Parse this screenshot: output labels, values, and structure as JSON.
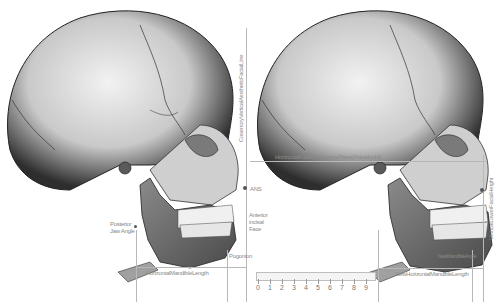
{
  "left_panel": {
    "title": "Original skull",
    "labels": {
      "vertical_line": "CoserroryVerticalAestheticFacialLine",
      "ans": "ANS",
      "anterior_incisal_face_1": "Anterior",
      "anterior_incisal_face_2": "incisal",
      "anterior_incisal_face_3": "Face",
      "posterior_jaw_angle_1": "Posterior",
      "posterior_jaw_angle_2": "Jaw Angle",
      "pogonion": "Pogonion",
      "horizontal_mandible_length": "HorizontalMandibleLength"
    }
  },
  "right_panel": {
    "title": "Modified skull",
    "labels": {
      "horizontal_reference_plane": "HorizontalFacialReferencePlane(FrankfurtH)",
      "vertical_lower_facial_height": "VerticalLowerFacialHeight",
      "new_horizontal_mandible_length": "NewHorizontalMandibleLength",
      "new_mandible_angle": "NewMandibleAngle"
    }
  },
  "ruler": {
    "ticks": [
      "0",
      "1",
      "2",
      "3",
      "4",
      "5",
      "6",
      "7",
      "8",
      "9"
    ],
    "unit": "cm"
  },
  "colors": {
    "bone_light": "#e8e8e8",
    "bone_mid": "#9a9a9a",
    "bone_dark": "#3a3a3a",
    "mandible": "#6b6b6b",
    "guide_line": "#b8b8b8",
    "label_text": "#8a8a8a"
  }
}
